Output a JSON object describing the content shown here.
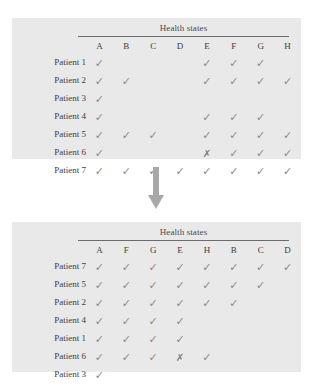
{
  "figure": {
    "arrow_icon": "arrow-down-icon",
    "arrow_color": "#a8a8a8",
    "panel_color": "#e9e9e9",
    "mark_color": "#8a8a8a",
    "cross_color": "#7d7d7d"
  },
  "tables": [
    {
      "id": "before",
      "group_header": "Health states",
      "row_label_header": "",
      "columns": [
        "A",
        "B",
        "C",
        "D",
        "E",
        "F",
        "G",
        "H"
      ],
      "rows": [
        {
          "label": "Patient 1",
          "marks": [
            "check",
            "",
            "",
            "",
            "check",
            "check",
            "check",
            ""
          ]
        },
        {
          "label": "Patient 2",
          "marks": [
            "check",
            "check",
            "",
            "",
            "check",
            "check",
            "check",
            "check"
          ]
        },
        {
          "label": "Patient 3",
          "marks": [
            "check",
            "",
            "",
            "",
            "",
            "",
            "",
            ""
          ]
        },
        {
          "label": "Patient 4",
          "marks": [
            "check",
            "",
            "",
            "",
            "check",
            "check",
            "check",
            ""
          ]
        },
        {
          "label": "Patient 5",
          "marks": [
            "check",
            "check",
            "check",
            "",
            "check",
            "check",
            "check",
            "check"
          ]
        },
        {
          "label": "Patient 6",
          "marks": [
            "check",
            "",
            "",
            "",
            "cross",
            "check",
            "check",
            "check"
          ]
        },
        {
          "label": "Patient 7",
          "marks": [
            "check",
            "check",
            "check",
            "check",
            "check",
            "check",
            "check",
            "check"
          ]
        }
      ]
    },
    {
      "id": "after",
      "group_header": "Health states",
      "row_label_header": "",
      "columns": [
        "A",
        "F",
        "G",
        "E",
        "H",
        "B",
        "C",
        "D"
      ],
      "rows": [
        {
          "label": "Patient 7",
          "marks": [
            "check",
            "check",
            "check",
            "check",
            "check",
            "check",
            "check",
            "check"
          ]
        },
        {
          "label": "Patient 5",
          "marks": [
            "check",
            "check",
            "check",
            "check",
            "check",
            "check",
            "check",
            ""
          ]
        },
        {
          "label": "Patient 2",
          "marks": [
            "check",
            "check",
            "check",
            "check",
            "check",
            "check",
            "",
            ""
          ]
        },
        {
          "label": "Patient 4",
          "marks": [
            "check",
            "check",
            "check",
            "check",
            "",
            "",
            "",
            ""
          ]
        },
        {
          "label": "Patient 1",
          "marks": [
            "check",
            "check",
            "check",
            "check",
            "",
            "",
            "",
            ""
          ]
        },
        {
          "label": "Patient 6",
          "marks": [
            "check",
            "check",
            "check",
            "cross",
            "check",
            "",
            "",
            ""
          ]
        },
        {
          "label": "Patient 3",
          "marks": [
            "check",
            "",
            "",
            "",
            "",
            "",
            "",
            ""
          ]
        }
      ]
    }
  ],
  "glyphs": {
    "check": "✓",
    "cross": "✗"
  }
}
